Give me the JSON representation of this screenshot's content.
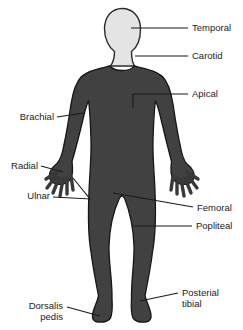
{
  "labels": {
    "temporal": "Temporal",
    "carotid": "Carotid",
    "apical": "Apical",
    "brachial": "Brachial",
    "radial": "Radial",
    "ulnar": "Ulnar",
    "femoral": "Femoral",
    "popliteal": "Popliteal",
    "posterial_tibial_line1": "Posterial",
    "posterial_tibial_line2": "tibial",
    "dorsalis_pedis_line1": "Dorsalis",
    "dorsalis_pedis_line2": "pedis"
  },
  "colors": {
    "background": "#ffffff",
    "body_fill": "#414141",
    "body_outline": "#161616",
    "head_fill": "#e4e4e4",
    "head_outline": "#2b2b2b",
    "leader_line": "#1a1a1a",
    "label_text": "#1c1c1c"
  }
}
